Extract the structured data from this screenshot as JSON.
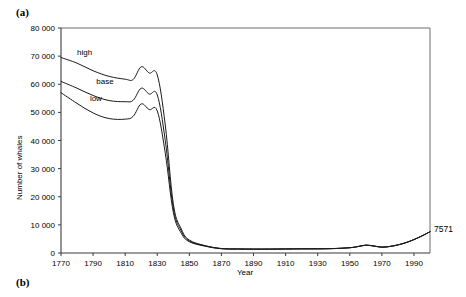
{
  "figure": {
    "panel_a_label": "(a)",
    "panel_b_label": "(b)"
  },
  "chart_data": {
    "type": "line",
    "title": "",
    "xlabel": "Year",
    "ylabel": "Number of whales",
    "xlim": [
      1770,
      2000
    ],
    "ylim": [
      0,
      80000
    ],
    "grid": false,
    "legend_position": "inline-annotations",
    "xticks": [
      1770,
      1790,
      1810,
      1830,
      1850,
      1870,
      1890,
      1910,
      1930,
      1950,
      1970,
      1990
    ],
    "xtick_labels": [
      "1770",
      "1790",
      "1810",
      "1830",
      "1850",
      "1870",
      "1890",
      "1910",
      "1930",
      "1950",
      "1970",
      "1990"
    ],
    "yticks": [
      0,
      10000,
      20000,
      30000,
      40000,
      50000,
      60000,
      70000,
      80000
    ],
    "ytick_labels": [
      "0",
      "10 000",
      "20 000",
      "30 000",
      "40 000",
      "50 000",
      "60 000",
      "70 000",
      "80 000"
    ],
    "annotations": [
      {
        "text": "7571",
        "x": 2000,
        "y": 7571,
        "placement": "right-of-axis"
      }
    ],
    "series": [
      {
        "name": "high",
        "label": "high",
        "label_x": 1780,
        "label_y": 70500,
        "x": [
          1770,
          1780,
          1790,
          1800,
          1810,
          1815,
          1820,
          1825,
          1830,
          1835,
          1840,
          1845,
          1850,
          1860,
          1870,
          1880,
          1890,
          1900,
          1910,
          1920,
          1930,
          1940,
          1950,
          1955,
          1960,
          1965,
          1970,
          1975,
          1980,
          1985,
          1990,
          1995,
          2000
        ],
        "values": [
          69500,
          67500,
          64800,
          62800,
          61800,
          61700,
          66200,
          64000,
          63300,
          45500,
          17500,
          8500,
          4600,
          2600,
          1600,
          1450,
          1400,
          1400,
          1450,
          1500,
          1500,
          1600,
          1900,
          2300,
          2800,
          2500,
          2100,
          2350,
          2900,
          3700,
          4800,
          6100,
          7571
        ]
      },
      {
        "name": "base",
        "label": "base",
        "label_x": 1792,
        "label_y": 60200,
        "x": [
          1770,
          1780,
          1790,
          1800,
          1810,
          1815,
          1820,
          1825,
          1830,
          1835,
          1840,
          1845,
          1850,
          1860,
          1870,
          1880,
          1890,
          1900,
          1910,
          1920,
          1930,
          1940,
          1950,
          1955,
          1960,
          1965,
          1970,
          1975,
          1980,
          1985,
          1990,
          1995,
          2000
        ],
        "values": [
          61000,
          58600,
          56000,
          54200,
          53800,
          54300,
          58600,
          56500,
          56200,
          40000,
          16000,
          7800,
          4300,
          2500,
          1550,
          1420,
          1380,
          1390,
          1430,
          1480,
          1490,
          1580,
          1880,
          2280,
          2780,
          2480,
          2080,
          2330,
          2880,
          3680,
          4780,
          6080,
          7571
        ]
      },
      {
        "name": "low",
        "label": "low",
        "label_x": 1788,
        "label_y": 54200,
        "x": [
          1770,
          1780,
          1790,
          1800,
          1810,
          1815,
          1820,
          1825,
          1830,
          1835,
          1840,
          1845,
          1850,
          1860,
          1870,
          1880,
          1890,
          1900,
          1910,
          1920,
          1930,
          1940,
          1950,
          1955,
          1960,
          1965,
          1970,
          1975,
          1980,
          1985,
          1990,
          1995,
          2000
        ],
        "values": [
          57000,
          53200,
          49800,
          47800,
          47600,
          48600,
          53000,
          51000,
          50500,
          35500,
          14500,
          7000,
          4000,
          2400,
          1500,
          1400,
          1360,
          1370,
          1410,
          1460,
          1470,
          1560,
          1860,
          2260,
          2760,
          2460,
          2060,
          2310,
          2860,
          3660,
          4760,
          6060,
          7571
        ]
      }
    ]
  }
}
